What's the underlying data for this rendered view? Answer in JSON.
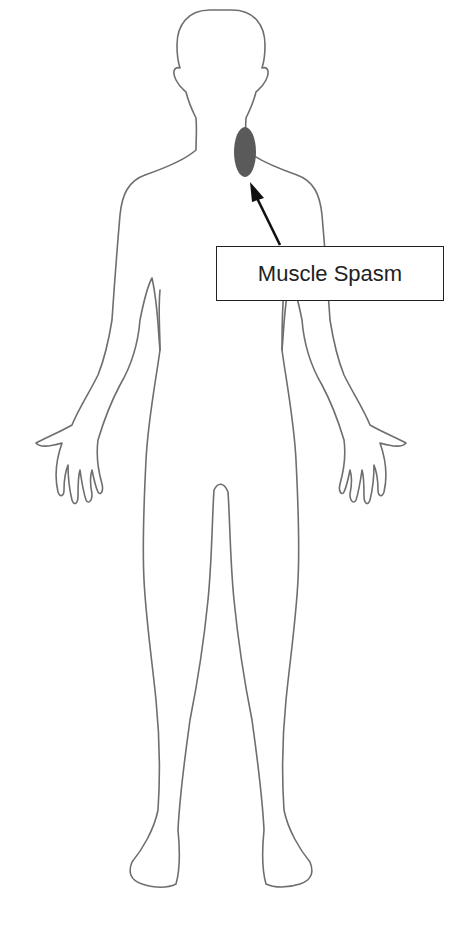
{
  "diagram": {
    "type": "body-outline",
    "view": "front",
    "marker": {
      "region": "neck (right side)",
      "shape": "ellipse",
      "color": "#5a5a5a"
    },
    "callout": {
      "label": "Muscle Spasm",
      "arrow_color": "#111111"
    }
  }
}
